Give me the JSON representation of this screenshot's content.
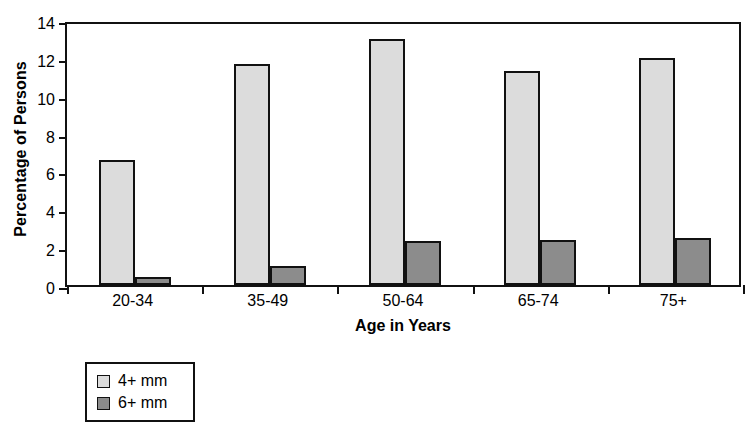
{
  "chart_data": {
    "type": "bar",
    "title": "",
    "xlabel": "Age in Years",
    "ylabel": "Percentage of Persons",
    "categories": [
      "20-34",
      "35-49",
      "50-64",
      "65-74",
      "75+"
    ],
    "series": [
      {
        "name": "4+ mm",
        "color": "#dcdcdc",
        "values": [
          6.6,
          11.7,
          13.0,
          11.3,
          12.0
        ]
      },
      {
        "name": "6+ mm",
        "color": "#8c8c8c",
        "values": [
          0.4,
          1.0,
          2.3,
          2.4,
          2.5
        ]
      }
    ],
    "ylim": [
      0,
      14
    ],
    "yticks": [
      0,
      2,
      4,
      6,
      8,
      10,
      12,
      14
    ],
    "ytick_labels": [
      "0",
      "2",
      "4",
      "6",
      "8",
      "10",
      "12",
      "14"
    ],
    "grid": false,
    "legend_position": "below-left",
    "frame": true
  },
  "legend": {
    "items": [
      {
        "label": "4+ mm",
        "swatch": "legend-swatch-light"
      },
      {
        "label": "6+ mm",
        "swatch": "legend-swatch-dark"
      }
    ]
  },
  "axes": {
    "y_title": "Percentage of Persons",
    "x_title": "Age in Years"
  }
}
